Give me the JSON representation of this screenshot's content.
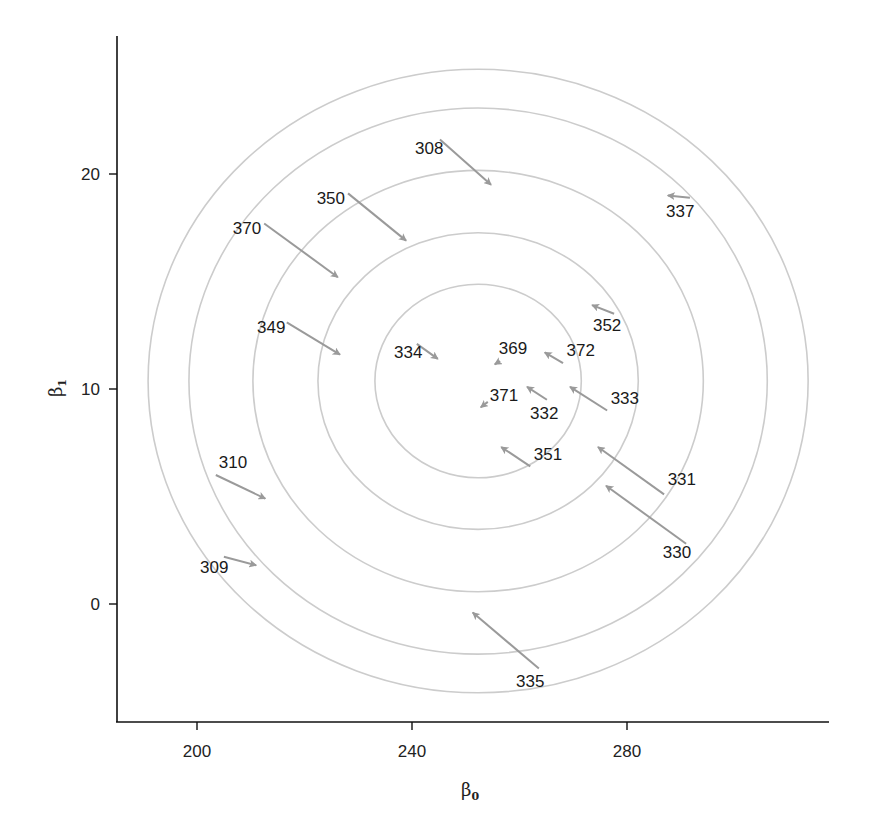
{
  "chart_data": {
    "type": "scatter",
    "subtype": "arrow-vector-field-with-contours",
    "title": "",
    "xlabel": "β",
    "xlabel_subscript": "0",
    "ylabel": "β",
    "ylabel_subscript": "1",
    "xlim": [
      185,
      304
    ],
    "ylim": [
      -5.5,
      26.5
    ],
    "xticks": [
      200,
      240,
      280
    ],
    "yticks": [
      0,
      10,
      20
    ],
    "grid": false,
    "legend": null,
    "colors": {
      "axis": "#111111",
      "contour": "#cccccc",
      "arrow": "#9a9a9a",
      "text": "#1a1a1a"
    },
    "contours": {
      "center": [
        252.3,
        10.37
      ],
      "ellipses": [
        {
          "rx": 61.4,
          "ry": 14.5
        },
        {
          "rx": 53.8,
          "ry": 12.7
        },
        {
          "rx": 41.9,
          "ry": 9.8
        },
        {
          "rx": 29.8,
          "ry": 6.9
        },
        {
          "rx": 19.2,
          "ry": 4.5
        }
      ]
    },
    "arrows": [
      {
        "label": "308",
        "from": [
          245.2,
          21.6
        ],
        "to": [
          254.7,
          19.5
        ],
        "label_pos": [
          243.2,
          21.2
        ]
      },
      {
        "label": "350",
        "from": [
          228.1,
          19.1
        ],
        "to": [
          238.9,
          16.9
        ],
        "label_pos": [
          224.9,
          18.9
        ]
      },
      {
        "label": "370",
        "from": [
          212.5,
          17.7
        ],
        "to": [
          226.2,
          15.2
        ],
        "label_pos": [
          209.3,
          17.5
        ]
      },
      {
        "label": "349",
        "from": [
          216.7,
          13.1
        ],
        "to": [
          226.6,
          11.6
        ],
        "label_pos": [
          213.8,
          12.9
        ]
      },
      {
        "label": "334",
        "from": [
          240.9,
          12.1
        ],
        "to": [
          244.8,
          11.4
        ],
        "label_pos": [
          239.3,
          11.7
        ]
      },
      {
        "label": "369",
        "from": [
          256.4,
          11.3
        ],
        "to": [
          255.4,
          11.15
        ],
        "label_pos": [
          258.8,
          11.9
        ]
      },
      {
        "label": "372",
        "from": [
          268.1,
          11.2
        ],
        "to": [
          264.7,
          11.7
        ],
        "label_pos": [
          271.4,
          11.8
        ]
      },
      {
        "label": "352",
        "from": [
          277.6,
          13.5
        ],
        "to": [
          273.5,
          13.9
        ],
        "label_pos": [
          276.3,
          13.0
        ]
      },
      {
        "label": "337",
        "from": [
          291.7,
          18.9
        ],
        "to": [
          287.6,
          19.0
        ],
        "label_pos": [
          289.9,
          18.3
        ]
      },
      {
        "label": "371",
        "from": [
          254.1,
          9.4
        ],
        "to": [
          252.8,
          9.15
        ],
        "label_pos": [
          257.1,
          9.7
        ]
      },
      {
        "label": "332",
        "from": [
          265.1,
          9.5
        ],
        "to": [
          261.4,
          10.1
        ],
        "label_pos": [
          264.6,
          8.9
        ]
      },
      {
        "label": "333",
        "from": [
          276.3,
          9.0
        ],
        "to": [
          269.4,
          10.1
        ],
        "label_pos": [
          279.6,
          9.6
        ]
      },
      {
        "label": "351",
        "from": [
          262.0,
          6.4
        ],
        "to": [
          256.6,
          7.3
        ],
        "label_pos": [
          265.3,
          7.0
        ]
      },
      {
        "label": "331",
        "from": [
          286.9,
          5.1
        ],
        "to": [
          274.6,
          7.3
        ],
        "label_pos": [
          290.2,
          5.8
        ]
      },
      {
        "label": "330",
        "from": [
          291.0,
          2.8
        ],
        "to": [
          276.1,
          5.5
        ],
        "label_pos": [
          289.3,
          2.4
        ]
      },
      {
        "label": "310",
        "from": [
          203.5,
          6.0
        ],
        "to": [
          212.7,
          4.9
        ],
        "label_pos": [
          206.7,
          6.6
        ]
      },
      {
        "label": "309",
        "from": [
          205.0,
          2.2
        ],
        "to": [
          211.0,
          1.8
        ],
        "label_pos": [
          203.2,
          1.7
        ]
      },
      {
        "label": "335",
        "from": [
          263.6,
          -3.0
        ],
        "to": [
          251.3,
          -0.4
        ],
        "label_pos": [
          262.0,
          -3.6
        ]
      }
    ]
  }
}
